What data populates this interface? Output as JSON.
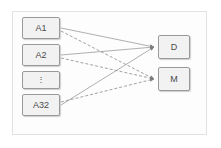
{
  "diagram": {
    "title": "",
    "frame": {
      "border_color": "#e2e2e2",
      "fill": "#fdfdfd"
    },
    "node_style": {
      "fill": "#f2f2f2",
      "stroke": "#9a9a9a",
      "text_color": "#4a4a4a"
    },
    "edge_style": {
      "solid_color": "#9a9a9a",
      "dashed_color": "#8a8a8a",
      "dash_pattern": "3 2"
    },
    "inputs": [
      {
        "id": "a1",
        "label": "A1",
        "x": 22,
        "y": 17,
        "w": 38,
        "h": 22
      },
      {
        "id": "a2",
        "label": "A2",
        "x": 22,
        "y": 44,
        "w": 38,
        "h": 22
      },
      {
        "id": "adots",
        "label": "⋮",
        "x": 22,
        "y": 71,
        "w": 38,
        "h": 18
      },
      {
        "id": "a32",
        "label": "A32",
        "x": 22,
        "y": 94,
        "w": 38,
        "h": 22
      }
    ],
    "outputs": [
      {
        "id": "d",
        "label": "D",
        "x": 158,
        "y": 35,
        "w": 32,
        "h": 24
      },
      {
        "id": "m",
        "label": "M",
        "x": 158,
        "y": 67,
        "w": 32,
        "h": 24
      }
    ],
    "edges": [
      {
        "from": "a1",
        "to": "d",
        "style": "solid"
      },
      {
        "from": "a2",
        "to": "d",
        "style": "solid"
      },
      {
        "from": "a32",
        "to": "d",
        "style": "solid"
      },
      {
        "from": "a1",
        "to": "m",
        "style": "dashed"
      },
      {
        "from": "a2",
        "to": "m",
        "style": "dashed"
      },
      {
        "from": "a32",
        "to": "m",
        "style": "dashed"
      }
    ]
  }
}
